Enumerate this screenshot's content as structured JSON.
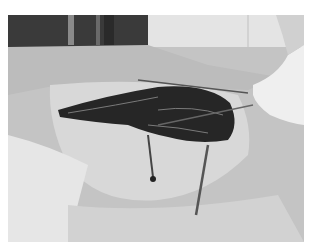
{
  "image": {
    "description": "Grayscale surgical photograph showing an open wound with sutures and retracting instruments held by a gloved hand, surrounded by surgical drapes",
    "colors": {
      "background_dark": "#3a3a3a",
      "drape": "#c8c8c8",
      "drape_light": "#dcdcdc",
      "skin": "#d6d6d6",
      "wound": "#262626",
      "glove": "#efefef",
      "border": "#ffffff"
    }
  }
}
